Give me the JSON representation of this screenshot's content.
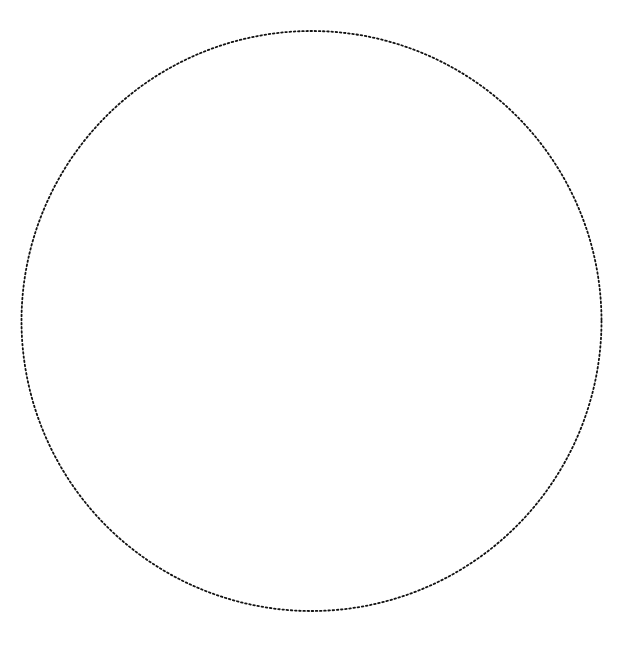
{
  "diagram": {
    "background": "#ffffff",
    "shapes": [
      {
        "type": "circle",
        "cx": 311.5,
        "cy": 321,
        "r": 290,
        "stroke": "#111111",
        "stroke_width": 1.8,
        "dash": "1.6 2.6",
        "fill": "none",
        "style": "dotted"
      }
    ]
  }
}
